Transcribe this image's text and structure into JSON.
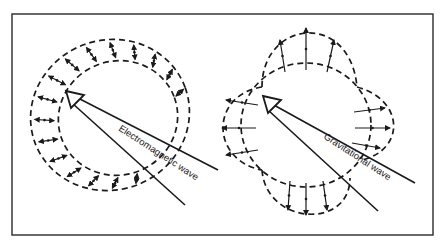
{
  "figure": {
    "border_color": "#2a2a2a",
    "line_color": "#1a1a1a",
    "background": "#ffffff"
  },
  "panels": [
    {
      "id": "electromagnetic",
      "label": "Electromagnetic wave",
      "pattern": "dashed annulus with double-headed transverse arrows",
      "arrow_style": "double-headed"
    },
    {
      "id": "gravitational",
      "label": "Gravitational wave",
      "pattern": "four-lobed dashed quadrupole around inner ellipse",
      "arrow_style": "outward radial"
    }
  ]
}
